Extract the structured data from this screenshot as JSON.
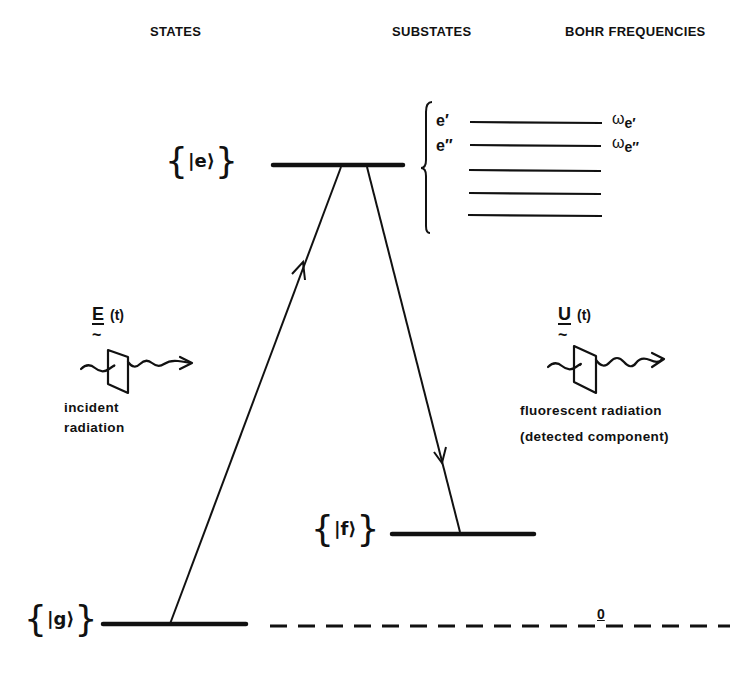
{
  "headers": {
    "states": "STATES",
    "substates": "SUBSTATES",
    "bohr_frequencies": "BOHR FREQUENCIES"
  },
  "states": {
    "excited": {
      "label": "|e⟩",
      "level_y": 165,
      "x1": 273,
      "x2": 403
    },
    "final": {
      "label": "|f⟩",
      "level_y": 534,
      "x1": 392,
      "x2": 534
    },
    "ground": {
      "label": "|g⟩",
      "level_y": 624,
      "x1": 103,
      "x2": 246
    }
  },
  "substates": {
    "labels": [
      "e′",
      "e″"
    ],
    "levels_y": [
      122,
      145,
      170,
      193,
      215
    ],
    "x1": 470,
    "x2": 602
  },
  "bohr_frequencies": {
    "items": [
      {
        "symbol": "ω",
        "subscript": "e′"
      },
      {
        "symbol": "ω",
        "subscript": "e″"
      }
    ],
    "zero_label": "0"
  },
  "transitions": [
    {
      "name": "absorption",
      "from": "g",
      "to": "e",
      "direction": "up"
    },
    {
      "name": "emission",
      "from": "e",
      "to": "f",
      "direction": "down"
    }
  ],
  "incident": {
    "symbol": "E",
    "arg": "(t)",
    "caption_line1": "incident",
    "caption_line2": "radiation"
  },
  "fluorescent": {
    "symbol": "U",
    "arg": "(t)",
    "caption_line1": "fluorescent radiation",
    "caption_line2": "(detected component)"
  },
  "glyphs": {
    "tilde": "~",
    "left_brace": "{",
    "right_brace": "}"
  }
}
